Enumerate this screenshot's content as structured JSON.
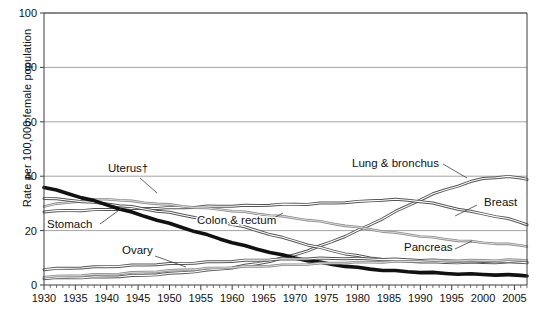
{
  "chart_data": {
    "type": "line",
    "title": "",
    "subtitle": "",
    "xlabel": "",
    "ylabel": "Rate per 100,000 female population",
    "xlim": [
      1930,
      2007
    ],
    "ylim": [
      0,
      100
    ],
    "yticks": [
      0,
      20,
      40,
      60,
      80,
      100
    ],
    "xticks": [
      1930,
      1935,
      1940,
      1945,
      1950,
      1955,
      1960,
      1965,
      1970,
      1975,
      1980,
      1985,
      1990,
      1995,
      2000,
      2005
    ],
    "xtick_labels": [
      "1930",
      "1935",
      "1940",
      "1945",
      "1950",
      "1955",
      "1960",
      "1965",
      "1970",
      "1975",
      "1980",
      "1985",
      "1990",
      "1995",
      "2000",
      "2005"
    ],
    "ytick_labels": [
      "0",
      "20",
      "40",
      "60",
      "80",
      "100"
    ],
    "xminor_step": 1,
    "grid": "horizontal",
    "legend": "inline-annotations",
    "x": [
      1930,
      1932,
      1934,
      1936,
      1938,
      1940,
      1942,
      1944,
      1946,
      1948,
      1950,
      1952,
      1954,
      1956,
      1958,
      1960,
      1962,
      1964,
      1966,
      1968,
      1970,
      1972,
      1974,
      1976,
      1978,
      1980,
      1982,
      1984,
      1986,
      1988,
      1990,
      1992,
      1994,
      1996,
      1998,
      2000,
      2002,
      2004,
      2006,
      2007
    ],
    "series": [
      {
        "name": "Lung & bronchus",
        "label": "Lung & bronchus",
        "emphasis": "medium",
        "values": [
          2.5,
          2.6,
          2.7,
          2.8,
          2.9,
          3.0,
          3.2,
          3.4,
          3.6,
          3.9,
          4.2,
          4.6,
          5.0,
          5.4,
          5.9,
          6.4,
          7.1,
          7.9,
          8.8,
          9.9,
          11.2,
          12.7,
          14.3,
          16.1,
          18.0,
          20.0,
          22.2,
          24.5,
          26.9,
          29.2,
          31.4,
          33.4,
          35.1,
          36.5,
          37.9,
          39.2,
          39.6,
          39.8,
          39.4,
          39.0
        ]
      },
      {
        "name": "Breast",
        "label": "Breast",
        "emphasis": "medium",
        "values": [
          27.0,
          27.2,
          27.4,
          27.5,
          27.6,
          27.8,
          27.9,
          28.0,
          28.2,
          28.3,
          28.4,
          28.5,
          28.7,
          28.9,
          29.0,
          29.1,
          29.2,
          29.3,
          29.5,
          29.6,
          29.7,
          29.8,
          30.0,
          30.2,
          30.4,
          30.6,
          31.0,
          31.3,
          31.4,
          31.2,
          30.8,
          30.0,
          29.0,
          28.0,
          27.0,
          26.2,
          25.3,
          24.3,
          23.0,
          22.3
        ]
      },
      {
        "name": "Colon & rectum",
        "label": "Colon & rectum",
        "emphasis": "light",
        "values": [
          29.0,
          29.8,
          30.4,
          31.0,
          31.4,
          31.6,
          31.3,
          30.8,
          30.3,
          30.0,
          29.5,
          29.0,
          28.6,
          28.2,
          27.8,
          27.3,
          26.8,
          26.2,
          25.7,
          25.2,
          24.6,
          24.0,
          23.3,
          22.6,
          21.9,
          21.2,
          20.5,
          19.8,
          19.2,
          18.6,
          18.0,
          17.4,
          16.9,
          16.4,
          16.0,
          15.6,
          15.3,
          15.0,
          14.6,
          14.3
        ]
      },
      {
        "name": "Uterus",
        "label": "Uterus†",
        "emphasis": "medium",
        "values": [
          32.0,
          31.6,
          31.2,
          30.8,
          30.3,
          29.8,
          29.3,
          28.7,
          28.0,
          27.3,
          26.6,
          25.8,
          25.0,
          24.2,
          23.3,
          22.4,
          21.3,
          20.0,
          18.7,
          17.4,
          16.2,
          14.9,
          13.7,
          12.6,
          11.6,
          10.7,
          10.0,
          9.5,
          9.1,
          8.8,
          8.6,
          8.4,
          8.3,
          8.3,
          8.3,
          8.3,
          8.3,
          8.4,
          8.5,
          8.5
        ]
      },
      {
        "name": "Stomach",
        "label": "Stomach",
        "emphasis": "heavy",
        "values": [
          36.0,
          34.8,
          33.5,
          32.2,
          30.9,
          29.5,
          28.1,
          26.7,
          25.3,
          24.0,
          22.6,
          21.2,
          19.8,
          18.4,
          17.0,
          15.7,
          14.4,
          13.2,
          12.1,
          11.0,
          10.0,
          9.1,
          8.3,
          7.6,
          7.0,
          6.4,
          5.9,
          5.5,
          5.2,
          4.9,
          4.7,
          4.5,
          4.3,
          4.1,
          4.0,
          3.9,
          3.8,
          3.7,
          3.6,
          3.5
        ]
      },
      {
        "name": "Ovary",
        "label": "Ovary",
        "emphasis": "medium",
        "values": [
          5.8,
          6.0,
          6.2,
          6.4,
          6.6,
          6.8,
          7.0,
          7.2,
          7.4,
          7.6,
          7.8,
          8.0,
          8.2,
          8.4,
          8.6,
          8.8,
          9.0,
          9.2,
          9.4,
          9.5,
          9.6,
          9.7,
          9.8,
          9.8,
          9.8,
          9.7,
          9.6,
          9.5,
          9.4,
          9.3,
          9.2,
          9.1,
          9.0,
          8.9,
          8.8,
          8.7,
          8.6,
          8.5,
          8.4,
          8.3
        ]
      },
      {
        "name": "Pancreas",
        "label": "Pancreas",
        "emphasis": "light",
        "values": [
          3.0,
          3.2,
          3.4,
          3.6,
          3.8,
          4.0,
          4.2,
          4.5,
          4.8,
          5.0,
          5.3,
          5.6,
          5.8,
          6.1,
          6.3,
          6.5,
          6.7,
          6.9,
          7.1,
          7.3,
          7.5,
          7.7,
          7.9,
          8.1,
          8.2,
          8.3,
          8.4,
          8.5,
          8.6,
          8.7,
          8.8,
          8.9,
          8.9,
          9.0,
          9.0,
          9.1,
          9.1,
          9.2,
          9.2,
          9.2
        ]
      }
    ],
    "annotations": [
      {
        "name": "uterus-label",
        "text": "Uterus†",
        "x_px": 108,
        "y_px": 172
      },
      {
        "name": "stomach-label",
        "text": "Stomach",
        "x_px": 47,
        "y_px": 228
      },
      {
        "name": "colon-rectum-label",
        "text": "Colon & rectum",
        "x_px": 197,
        "y_px": 224
      },
      {
        "name": "ovary-label",
        "text": "Ovary",
        "x_px": 122,
        "y_px": 254
      },
      {
        "name": "lung-bronchus-label",
        "text": "Lung & bronchus",
        "x_px": 352,
        "y_px": 167
      },
      {
        "name": "breast-label",
        "text": "Breast",
        "x_px": 484,
        "y_px": 206
      },
      {
        "name": "pancreas-label",
        "text": "Pancreas",
        "x_px": 404,
        "y_px": 251
      }
    ],
    "colors": {
      "axis": "#3f3f3f",
      "grid": "#8c8c8c",
      "line_heavy": "#111111",
      "line_medium": "#555555",
      "line_light": "#8a8a8a",
      "text": "#111111",
      "background": "#ffffff"
    }
  }
}
